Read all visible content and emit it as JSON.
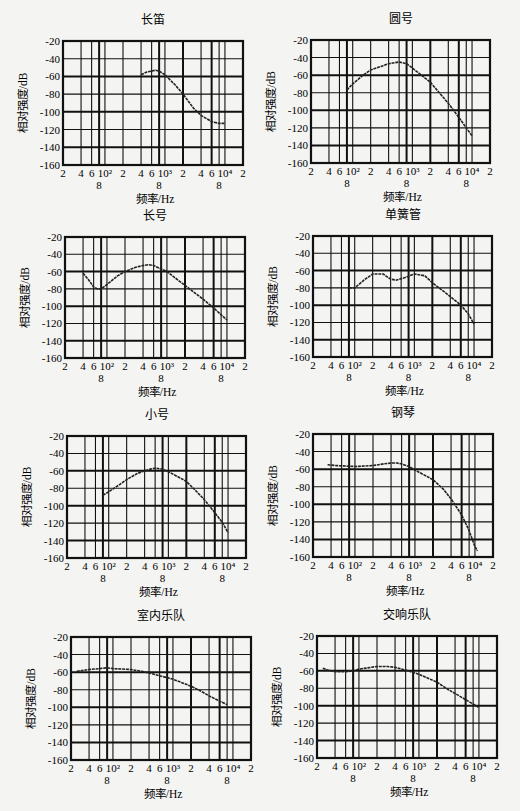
{
  "figure": {
    "xaxis_label": "频率/Hz",
    "yaxis_label": "相对强度/dB",
    "y_ticks": [
      "-20",
      "-40",
      "-60",
      "-80",
      "-100",
      "-120",
      "-140",
      "-160"
    ],
    "x_ticks_top_row": [
      "2",
      "4",
      "6",
      "10²",
      "2",
      "4",
      "6",
      "10³",
      "2",
      "4",
      "6",
      "10⁴",
      "2"
    ],
    "x_ticks_bottom_row": [
      "8",
      "8",
      "8"
    ]
  },
  "chart_data": [
    {
      "type": "line",
      "title": "长笛",
      "xlabel": "频率/Hz",
      "ylabel": "相对强度/dB",
      "xscale": "log",
      "xlim": [
        20,
        20000
      ],
      "ylim": [
        -160,
        -20
      ],
      "grid": true,
      "x": [
        400,
        500,
        600,
        700,
        800,
        1000,
        1500,
        2000,
        3000,
        4000,
        6000,
        8000,
        10000
      ],
      "values": [
        -58,
        -55,
        -54,
        -53,
        -54,
        -58,
        -70,
        -80,
        -96,
        -104,
        -111,
        -113,
        -113
      ]
    },
    {
      "type": "line",
      "title": "圆号",
      "xlabel": "频率/Hz",
      "ylabel": "相对强度/dB",
      "xscale": "log",
      "xlim": [
        20,
        20000
      ],
      "ylim": [
        -160,
        -20
      ],
      "grid": true,
      "x": [
        80,
        100,
        150,
        200,
        300,
        400,
        500,
        600,
        800,
        1000,
        2000,
        3000,
        4000,
        6000,
        8000,
        10000
      ],
      "values": [
        -77,
        -70,
        -60,
        -54,
        -50,
        -47,
        -46,
        -45,
        -47,
        -52,
        -68,
        -82,
        -92,
        -108,
        -120,
        -129
      ]
    },
    {
      "type": "line",
      "title": "长号",
      "xlabel": "频率/Hz",
      "ylabel": "相对强度/dB",
      "xscale": "log",
      "xlim": [
        20,
        20000
      ],
      "ylim": [
        -160,
        -20
      ],
      "grid": true,
      "x": [
        40,
        50,
        60,
        70,
        80,
        100,
        150,
        200,
        300,
        400,
        500,
        600,
        1000,
        2000,
        4000,
        6000,
        10000
      ],
      "values": [
        -62,
        -70,
        -78,
        -80,
        -80,
        -75,
        -65,
        -60,
        -55,
        -53,
        -52,
        -53,
        -60,
        -76,
        -92,
        -102,
        -116
      ]
    },
    {
      "type": "line",
      "title": "单簧管",
      "xlabel": "频率/Hz",
      "ylabel": "相对强度/dB",
      "xscale": "log",
      "xlim": [
        20,
        20000
      ],
      "ylim": [
        -160,
        -20
      ],
      "grid": true,
      "x": [
        80,
        100,
        150,
        200,
        300,
        400,
        500,
        700,
        1000,
        1500,
        2000,
        4000,
        6000,
        8000,
        10000
      ],
      "values": [
        -80,
        -80,
        -70,
        -64,
        -64,
        -70,
        -71,
        -68,
        -64,
        -66,
        -74,
        -90,
        -100,
        -110,
        -122
      ]
    },
    {
      "type": "line",
      "title": "小号",
      "xlabel": "频率/Hz",
      "ylabel": "相对强度/dB",
      "xscale": "log",
      "xlim": [
        20,
        20000
      ],
      "ylim": [
        -160,
        -20
      ],
      "grid": true,
      "x": [
        80,
        100,
        150,
        200,
        300,
        400,
        500,
        600,
        800,
        1000,
        2000,
        3000,
        4000,
        6000,
        8000,
        10000
      ],
      "values": [
        -88,
        -84,
        -76,
        -70,
        -63,
        -60,
        -58,
        -57,
        -58,
        -61,
        -72,
        -84,
        -93,
        -108,
        -119,
        -131
      ]
    },
    {
      "type": "line",
      "title": "钢琴",
      "xlabel": "频率/Hz",
      "ylabel": "相对强度/dB",
      "xscale": "log",
      "xlim": [
        20,
        20000
      ],
      "ylim": [
        -160,
        -20
      ],
      "grid": true,
      "x": [
        35,
        50,
        100,
        200,
        300,
        400,
        500,
        600,
        800,
        1000,
        2000,
        3000,
        4000,
        6000,
        8000,
        10000,
        11000
      ],
      "values": [
        -55,
        -56,
        -57,
        -56,
        -54,
        -53,
        -53,
        -54,
        -57,
        -61,
        -72,
        -83,
        -94,
        -112,
        -130,
        -148,
        -153
      ]
    },
    {
      "type": "line",
      "title": "室内乐队",
      "xlabel": "频率/Hz",
      "ylabel": "相对强度/dB",
      "xscale": "log",
      "xlim": [
        20,
        20000
      ],
      "ylim": [
        -160,
        -20
      ],
      "grid": true,
      "x": [
        25,
        40,
        60,
        80,
        100,
        200,
        300,
        400,
        600,
        1000,
        2000,
        3000,
        4000,
        6000,
        8000
      ],
      "values": [
        -59,
        -57,
        -56,
        -55,
        -56,
        -57,
        -59,
        -61,
        -64,
        -68,
        -76,
        -82,
        -87,
        -93,
        -97
      ]
    },
    {
      "type": "line",
      "title": "交响乐队",
      "xlabel": "频率/Hz",
      "ylabel": "相对强度/dB",
      "xscale": "log",
      "xlim": [
        20,
        20000
      ],
      "ylim": [
        -160,
        -20
      ],
      "grid": true,
      "x": [
        25,
        30,
        40,
        60,
        80,
        100,
        200,
        300,
        400,
        600,
        1000,
        2000,
        3000,
        4000,
        6000,
        8000,
        10000
      ],
      "values": [
        -57,
        -59,
        -61,
        -61,
        -60,
        -58,
        -55,
        -55,
        -56,
        -59,
        -64,
        -73,
        -81,
        -86,
        -93,
        -98,
        -102
      ]
    }
  ]
}
